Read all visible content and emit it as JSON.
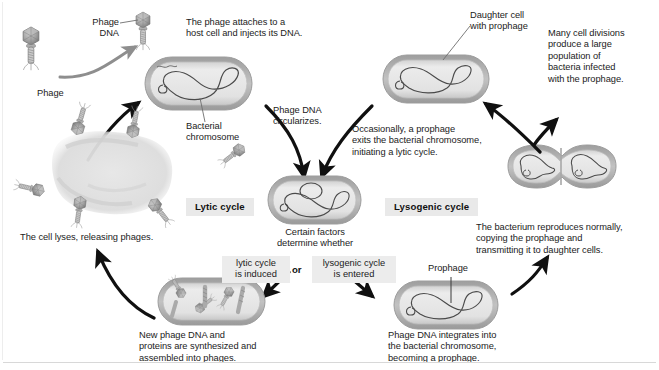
{
  "figure": {
    "cycles": {
      "lytic_label": "Lytic cycle",
      "lysogenic_label": "Lysogenic cycle"
    },
    "decision": {
      "prompt": "Certain factors\ndetermine whether",
      "option_left": "lytic cycle\nis induced",
      "conjunction": "or",
      "option_right": "lysogenic cycle\nis entered"
    },
    "labels": {
      "phage": "Phage",
      "phage_dna": "Phage\nDNA",
      "bacterial_chromosome": "Bacterial\nchromosome",
      "daughter_cell": "Daughter cell\nwith prophage",
      "prophage": "Prophage"
    },
    "captions": {
      "attach": "The phage attaches to a\nhost cell and injects its DNA.",
      "circularize": "Phage DNA\ncircularizes.",
      "exits": "Occasionally, a prophage\nexits the bacterial chromosome,\ninitiating a lytic cycle.",
      "many_divisions": "Many cell divisions\nproduce a large\npopulation of\nbacteria infected\nwith the prophage.",
      "reproduces": "The bacterium reproduces normally,\ncopying the prophage and\ntransmitting it to daughter cells.",
      "lyses": "The cell lyses, releasing phages.",
      "new_phage": "New phage DNA and\nproteins are synthesized and\nassembled into phages.",
      "integrates": "Phage DNA integrates into\nthe bacterial chromosome,\nbecoming a prophage."
    },
    "colors": {
      "page_background": "#ffffff",
      "text": "#1b1b1b",
      "cycle_tag_background": "#e9e9e9",
      "choice_tag_background": "#ececec",
      "cell_wall": "#b3b3b3",
      "cell_cytoplasm": "#e4e4e4",
      "chromosome_line": "#4a4a4a",
      "phage_body": "#9a9a9a",
      "arrow_black": "#101010",
      "arrow_gray": "#8e8e8e",
      "leader_line": "#6e6e6e",
      "rule": "#d8d8d8"
    },
    "icons": {
      "phage_free": "phage-icon",
      "phage_attached": "phage-attached-icon",
      "phage_circularizing": "phage-injecting-icon",
      "bacterium": "bacterium-icon",
      "bacterium_dividing": "dividing-bacterium-icon",
      "lysed_cell": "lysed-cell-icon",
      "assembly_cell": "phage-assembly-cell-icon",
      "arrow": "curved-arrow-icon"
    }
  }
}
